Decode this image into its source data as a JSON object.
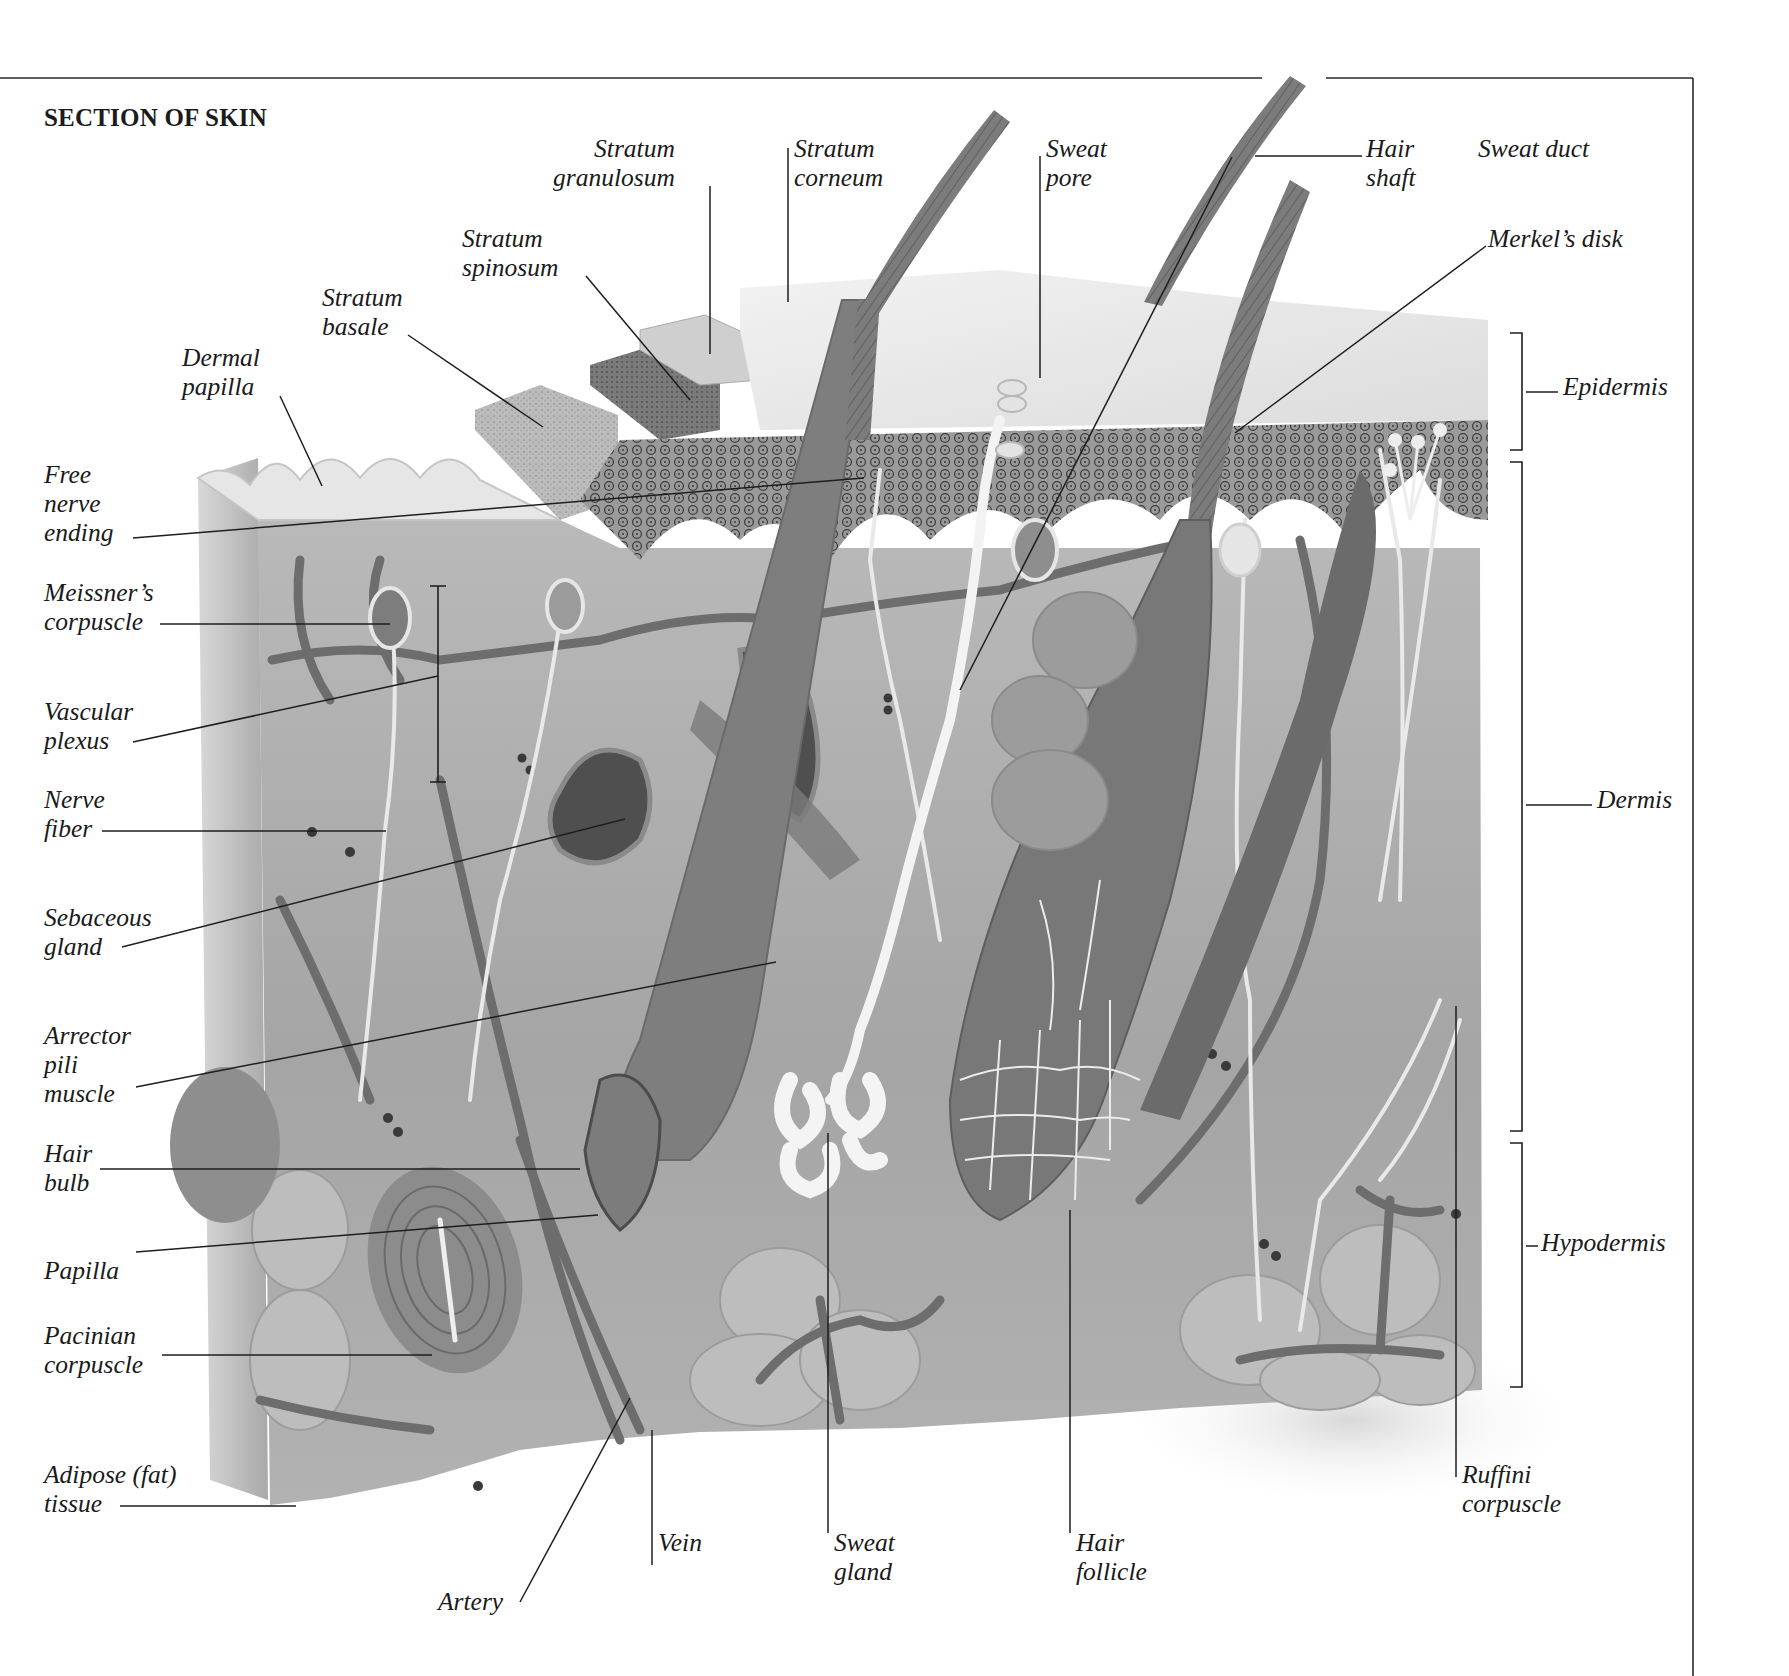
{
  "figure": {
    "title": "SECTION OF SKIN",
    "frame": {
      "top_y": 78,
      "right_x": 1693,
      "gap_x": [
        1262,
        1326
      ],
      "line_color": "#2a2a2a"
    },
    "palette": {
      "background": "#ffffff",
      "epidermis_surface": "#e9e9e9",
      "stratum_basale": "#bdbdbd",
      "stratum_spinosum": "#8a8a8a",
      "stratum_granulosum": "#d4d4d4",
      "dermis": "#a9a9a9",
      "hypodermis": "#b5b5b5",
      "vessel": "#6e6e6e",
      "nerve": "#e8e8e8",
      "hair": "#7d7d7d",
      "sebaceous": "#4e4e4e",
      "sweat_gland": "#f4f4f4"
    }
  },
  "labels": [
    {
      "id": "stratum-granulosum",
      "text": "Stratum\ngranulosum",
      "x": 553,
      "y": 134,
      "align": "right",
      "line": [
        [
          710,
          186
        ],
        [
          710,
          354
        ]
      ]
    },
    {
      "id": "stratum-corneum",
      "text": "Stratum\ncorneum",
      "x": 794,
      "y": 134,
      "align": "left",
      "line": [
        [
          788,
          148
        ],
        [
          788,
          302
        ]
      ]
    },
    {
      "id": "sweat-pore",
      "text": "Sweat\npore",
      "x": 1046,
      "y": 134,
      "align": "left",
      "line": [
        [
          1040,
          156
        ],
        [
          1040,
          378
        ]
      ]
    },
    {
      "id": "hair-shaft",
      "text": "Hair\nshaft",
      "x": 1366,
      "y": 134,
      "align": "left",
      "line": [
        [
          1255,
          156
        ],
        [
          1362,
          156
        ]
      ]
    },
    {
      "id": "sweat-duct",
      "text": "Sweat duct",
      "x": 1478,
      "y": 134,
      "align": "left",
      "line": [
        [
          1232,
          157
        ],
        [
          960,
          690
        ]
      ]
    },
    {
      "id": "stratum-spinosum",
      "text": "Stratum\nspinosum",
      "x": 462,
      "y": 224,
      "align": "left",
      "line": [
        [
          586,
          276
        ],
        [
          690,
          400
        ]
      ]
    },
    {
      "id": "merkels-disk",
      "text": "Merkel’s disk",
      "x": 1488,
      "y": 224,
      "align": "left",
      "line": [
        [
          1235,
          433
        ],
        [
          1486,
          246
        ]
      ]
    },
    {
      "id": "stratum-basale",
      "text": "Stratum\nbasale",
      "x": 322,
      "y": 283,
      "align": "left",
      "line": [
        [
          408,
          335
        ],
        [
          543,
          427
        ]
      ]
    },
    {
      "id": "dermal-papilla",
      "text": "Dermal\npapilla",
      "x": 182,
      "y": 343,
      "align": "left",
      "line": [
        [
          280,
          396
        ],
        [
          322,
          486
        ]
      ]
    },
    {
      "id": "epidermis",
      "text": "Epidermis",
      "x": 1563,
      "y": 372,
      "align": "left",
      "line": [
        [
          1526,
          392
        ],
        [
          1558,
          392
        ]
      ]
    },
    {
      "id": "free-nerve-ending",
      "text": "Free\nnerve\nending",
      "x": 44,
      "y": 460,
      "align": "left",
      "line": [
        [
          133,
          538
        ],
        [
          864,
          478
        ]
      ]
    },
    {
      "id": "meissners-corpuscle",
      "text": "Meissner’s\ncorpuscle",
      "x": 44,
      "y": 578,
      "align": "left",
      "line": [
        [
          160,
          624
        ],
        [
          390,
          624
        ]
      ]
    },
    {
      "id": "vascular-plexus",
      "text": "Vascular\nplexus",
      "x": 44,
      "y": 697,
      "align": "left",
      "line": [
        [
          133,
          742
        ],
        [
          438,
          676
        ]
      ]
    },
    {
      "id": "dermis",
      "text": "Dermis",
      "x": 1597,
      "y": 785,
      "align": "left",
      "line": [
        [
          1526,
          805
        ],
        [
          1592,
          805
        ]
      ]
    },
    {
      "id": "nerve-fiber",
      "text": "Nerve\nfiber",
      "x": 44,
      "y": 785,
      "align": "left",
      "line": [
        [
          102,
          831
        ],
        [
          386,
          831
        ]
      ]
    },
    {
      "id": "sebaceous-gland",
      "text": "Sebaceous\ngland",
      "x": 44,
      "y": 903,
      "align": "left",
      "line": [
        [
          122,
          947
        ],
        [
          625,
          819
        ]
      ]
    },
    {
      "id": "arrector-pili-muscle",
      "text": "Arrector\npili\nmuscle",
      "x": 44,
      "y": 1021,
      "align": "left",
      "line": [
        [
          136,
          1087
        ],
        [
          776,
          962
        ]
      ]
    },
    {
      "id": "hair-bulb",
      "text": "Hair\nbulb",
      "x": 44,
      "y": 1139,
      "align": "left",
      "line": [
        [
          100,
          1169
        ],
        [
          580,
          1169
        ]
      ]
    },
    {
      "id": "hypodermis",
      "text": "Hypodermis",
      "x": 1541,
      "y": 1228,
      "align": "left",
      "line": [
        [
          1526,
          1246
        ],
        [
          1538,
          1246
        ]
      ]
    },
    {
      "id": "papilla",
      "text": "Papilla",
      "x": 44,
      "y": 1256,
      "align": "left",
      "line": [
        [
          136,
          1252
        ],
        [
          598,
          1215
        ]
      ]
    },
    {
      "id": "pacinian-corpuscle",
      "text": "Pacinian\ncorpuscle",
      "x": 44,
      "y": 1321,
      "align": "left",
      "line": [
        [
          162,
          1355
        ],
        [
          432,
          1355
        ]
      ]
    },
    {
      "id": "adipose-tissue",
      "text": "Adipose (fat)\ntissue",
      "x": 44,
      "y": 1460,
      "align": "left",
      "line": [
        [
          120,
          1506
        ],
        [
          296,
          1506
        ]
      ]
    },
    {
      "id": "ruffini-corpuscle",
      "text": "Ruffini\ncorpuscle",
      "x": 1462,
      "y": 1460,
      "align": "left",
      "line": [
        [
          1456,
          1006
        ],
        [
          1456,
          1477
        ]
      ]
    },
    {
      "id": "artery",
      "text": "Artery",
      "x": 438,
      "y": 1587,
      "align": "left",
      "line": [
        [
          520,
          1602
        ],
        [
          630,
          1398
        ]
      ]
    },
    {
      "id": "vein",
      "text": "Vein",
      "x": 658,
      "y": 1528,
      "align": "left",
      "line": [
        [
          652,
          1430
        ],
        [
          652,
          1565
        ]
      ]
    },
    {
      "id": "sweat-gland",
      "text": "Sweat\ngland",
      "x": 834,
      "y": 1528,
      "align": "left",
      "line": [
        [
          828,
          1133
        ],
        [
          828,
          1533
        ]
      ]
    },
    {
      "id": "hair-follicle",
      "text": "Hair\nfollicle",
      "x": 1076,
      "y": 1528,
      "align": "left",
      "line": [
        [
          1070,
          1210
        ],
        [
          1070,
          1533
        ]
      ]
    }
  ],
  "brackets": [
    {
      "id": "epidermis-bracket",
      "x": 1522,
      "y1": 333,
      "y2": 450
    },
    {
      "id": "dermis-bracket",
      "x": 1522,
      "y1": 462,
      "y2": 1131
    },
    {
      "id": "hypodermis-bracket",
      "x": 1522,
      "y1": 1143,
      "y2": 1387
    },
    {
      "id": "vascular-plexus-bracket",
      "x": 438,
      "y1": 586,
      "y2": 782,
      "style": "I-beam"
    }
  ]
}
